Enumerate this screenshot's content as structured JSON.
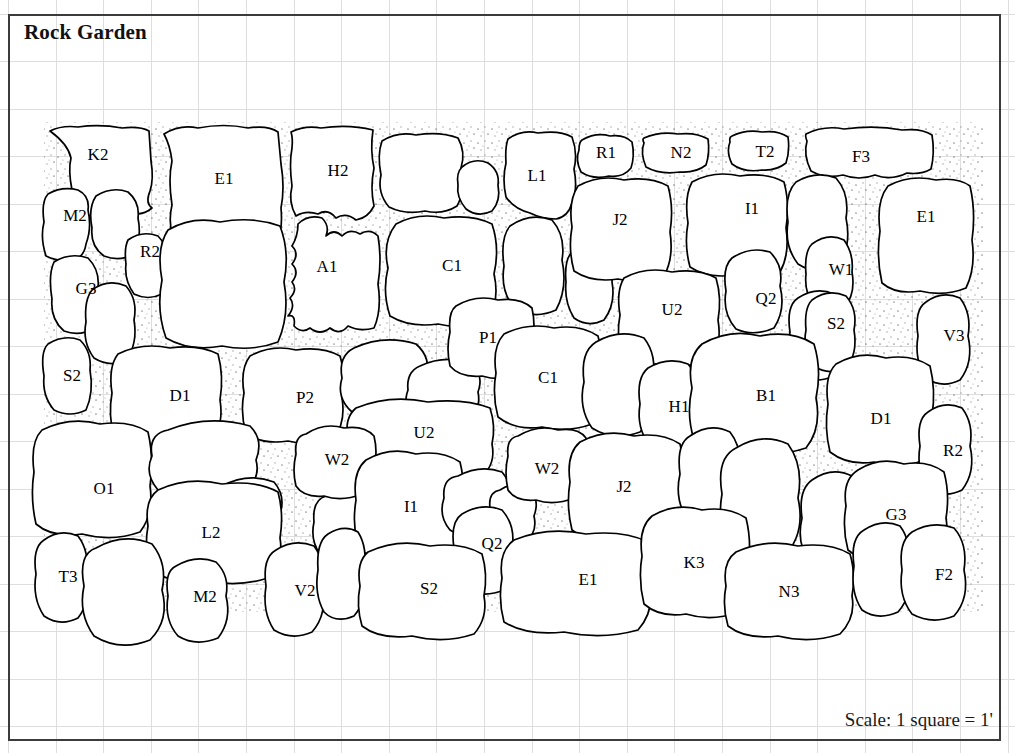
{
  "title": "Rock Garden",
  "scale_note": "Scale: 1 square = 1'",
  "colors": {
    "grid_line": "#dededf",
    "frame": "#3b3b3b",
    "stone_outline": "#000000",
    "stone_fill": "#ffffff",
    "hatch": "#000000",
    "text": "#000000"
  },
  "legend": {
    "grid_square_feet": 1,
    "grid_square_px": 47.5
  },
  "stones": [
    {
      "label": "K2",
      "x": 98,
      "y": 156,
      "hatched": false
    },
    {
      "label": "E1",
      "x": 224,
      "y": 180,
      "hatched": false
    },
    {
      "label": "H2",
      "x": 338,
      "y": 172,
      "hatched": false
    },
    {
      "label": "L1",
      "x": 537,
      "y": 177,
      "hatched": false
    },
    {
      "label": "R1",
      "x": 606,
      "y": 154,
      "hatched": false
    },
    {
      "label": "N2",
      "x": 681,
      "y": 154,
      "hatched": false
    },
    {
      "label": "T2",
      "x": 765,
      "y": 153,
      "hatched": false
    },
    {
      "label": "F3",
      "x": 861,
      "y": 158,
      "hatched": false
    },
    {
      "label": "M2",
      "x": 75,
      "y": 217,
      "hatched": false
    },
    {
      "label": "R2",
      "x": 150,
      "y": 253,
      "hatched": false
    },
    {
      "label": "G3",
      "x": 86,
      "y": 290,
      "hatched": false
    },
    {
      "label": "A1",
      "x": 327,
      "y": 268,
      "hatched": false
    },
    {
      "label": "C1",
      "x": 452,
      "y": 267,
      "hatched": false
    },
    {
      "label": "J2",
      "x": 620,
      "y": 221,
      "hatched": false
    },
    {
      "label": "I1",
      "x": 752,
      "y": 210,
      "hatched": false
    },
    {
      "label": "E1",
      "x": 926,
      "y": 218,
      "hatched": false
    },
    {
      "label": "W1",
      "x": 841,
      "y": 271,
      "hatched": false
    },
    {
      "label": "Q2",
      "x": 766,
      "y": 300,
      "hatched": false
    },
    {
      "label": "U2",
      "x": 672,
      "y": 311,
      "hatched": false
    },
    {
      "label": "S2",
      "x": 836,
      "y": 325,
      "hatched": false
    },
    {
      "label": "V3",
      "x": 954,
      "y": 337,
      "hatched": false
    },
    {
      "label": "S2",
      "x": 72,
      "y": 377,
      "hatched": false
    },
    {
      "label": "D1",
      "x": 180,
      "y": 397,
      "hatched": false
    },
    {
      "label": "P2",
      "x": 305,
      "y": 399,
      "hatched": false
    },
    {
      "label": "P1",
      "x": 488,
      "y": 339,
      "hatched": false
    },
    {
      "label": "C1",
      "x": 548,
      "y": 379,
      "hatched": false
    },
    {
      "label": "U2",
      "x": 424,
      "y": 434,
      "hatched": false
    },
    {
      "label": "H1",
      "x": 679,
      "y": 408,
      "hatched": false
    },
    {
      "label": "B1",
      "x": 766,
      "y": 397,
      "hatched": false
    },
    {
      "label": "D1",
      "x": 881,
      "y": 420,
      "hatched": false
    },
    {
      "label": "R2",
      "x": 953,
      "y": 452,
      "hatched": false
    },
    {
      "label": "W2",
      "x": 337,
      "y": 461,
      "hatched": false
    },
    {
      "label": "W2",
      "x": 547,
      "y": 470,
      "hatched": false
    },
    {
      "label": "J2",
      "x": 624,
      "y": 488,
      "hatched": false
    },
    {
      "label": "O1",
      "x": 104,
      "y": 490,
      "hatched": false
    },
    {
      "label": "I1",
      "x": 411,
      "y": 508,
      "hatched": false
    },
    {
      "label": "L2",
      "x": 211,
      "y": 534,
      "hatched": false
    },
    {
      "label": "Q2",
      "x": 492,
      "y": 545,
      "hatched": false
    },
    {
      "label": "G3",
      "x": 896,
      "y": 516,
      "hatched": false
    },
    {
      "label": "T3",
      "x": 68,
      "y": 578,
      "hatched": false
    },
    {
      "label": "M2",
      "x": 205,
      "y": 598,
      "hatched": false
    },
    {
      "label": "V2",
      "x": 305,
      "y": 592,
      "hatched": false
    },
    {
      "label": "S2",
      "x": 429,
      "y": 590,
      "hatched": false
    },
    {
      "label": "E1",
      "x": 588,
      "y": 581,
      "hatched": false
    },
    {
      "label": "K3",
      "x": 694,
      "y": 564,
      "hatched": false
    },
    {
      "label": "N3",
      "x": 789,
      "y": 593,
      "hatched": false
    },
    {
      "label": "F2",
      "x": 944,
      "y": 576,
      "hatched": false
    }
  ]
}
